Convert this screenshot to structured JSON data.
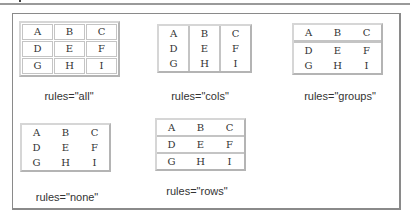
{
  "cells": [
    [
      "A",
      "B",
      "C"
    ],
    [
      "D",
      "E",
      "F"
    ],
    [
      "G",
      "H",
      "I"
    ]
  ],
  "examples": [
    {
      "id": "all",
      "caption": "rules=\"all\""
    },
    {
      "id": "cols",
      "caption": "rules=\"cols\""
    },
    {
      "id": "groups",
      "caption": "rules=\"groups\""
    },
    {
      "id": "none",
      "caption": "rules=\"none\""
    },
    {
      "id": "rows",
      "caption": "rules=\"rows\""
    }
  ],
  "colors": {
    "frame_border": "#8a8a8a",
    "table_rule": "#c4c4c4",
    "text": "#333333"
  }
}
